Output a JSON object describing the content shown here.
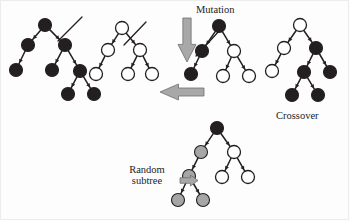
{
  "figure": {
    "background": "#fdfdfd",
    "width": 350,
    "height": 221
  },
  "palette": {
    "node_black": "#231f20",
    "node_white": "#ffffff",
    "node_gray": "#a6a6a6",
    "node_stroke": "#231f20",
    "edge": "#231f20",
    "arrow_fill": "#a8a8a8",
    "arrow_stroke": "#6f6f6f",
    "text": "#1c1c1c",
    "cut_line": "#231f20"
  },
  "labels": {
    "mutation": "Mutation",
    "crossover": "Crossover",
    "random_subtree": "Random\nsubtree",
    "random_subtree_line1": "Random",
    "random_subtree_line2": "subtree"
  },
  "arrows": [
    {
      "name": "mutation-arrow",
      "direction": "down",
      "x": 178,
      "y": 18,
      "width": 18,
      "height": 44,
      "fill": "#a8a8a8"
    },
    {
      "name": "crossover-arrow",
      "direction": "left",
      "x": 160,
      "y": 84,
      "width": 44,
      "height": 16,
      "fill": "#a8a8a8"
    },
    {
      "name": "random-subtree-arrow",
      "direction": "right",
      "x": 180,
      "y": 175,
      "width": 18,
      "height": 11,
      "fill": "#a8a8a8"
    }
  ],
  "trees": [
    {
      "name": "parent-tree-1",
      "role": "parent-1-black",
      "description": "Fully black parent tree with crossover cut mark on right edge from root",
      "cut_line": {
        "x1": 58,
        "y1": 41,
        "x2": 82,
        "y2": 17
      },
      "nodes": [
        {
          "id": "n0",
          "cx": 45,
          "cy": 25,
          "r": 6.5,
          "fill": "black"
        },
        {
          "id": "n1",
          "cx": 28,
          "cy": 45,
          "r": 6.5,
          "fill": "black"
        },
        {
          "id": "n2",
          "cx": 65,
          "cy": 45,
          "r": 6.5,
          "fill": "black"
        },
        {
          "id": "n3",
          "cx": 16,
          "cy": 70,
          "r": 6.5,
          "fill": "black"
        },
        {
          "id": "n4",
          "cx": 52,
          "cy": 70,
          "r": 6.5,
          "fill": "black"
        },
        {
          "id": "n5",
          "cx": 80,
          "cy": 71,
          "r": 6.5,
          "fill": "black"
        },
        {
          "id": "n6",
          "cx": 68,
          "cy": 94,
          "r": 6.5,
          "fill": "black"
        },
        {
          "id": "n7",
          "cx": 94,
          "cy": 94,
          "r": 6.5,
          "fill": "black"
        }
      ],
      "edges": [
        [
          "n0",
          "n1"
        ],
        [
          "n0",
          "n2"
        ],
        [
          "n1",
          "n3"
        ],
        [
          "n2",
          "n4"
        ],
        [
          "n2",
          "n5"
        ],
        [
          "n5",
          "n6"
        ],
        [
          "n5",
          "n7"
        ]
      ]
    },
    {
      "name": "parent-tree-2",
      "role": "parent-2-white",
      "description": "Fully white parent tree with crossover cut mark on right edge from root",
      "cut_line": {
        "x1": 124,
        "y1": 45,
        "x2": 146,
        "y2": 22
      },
      "nodes": [
        {
          "id": "n0",
          "cx": 122,
          "cy": 28,
          "r": 6.5,
          "fill": "white"
        },
        {
          "id": "n1",
          "cx": 108,
          "cy": 50,
          "r": 6.5,
          "fill": "white"
        },
        {
          "id": "n2",
          "cx": 140,
          "cy": 50,
          "r": 6.5,
          "fill": "white"
        },
        {
          "id": "n3",
          "cx": 96,
          "cy": 74,
          "r": 6.5,
          "fill": "white"
        },
        {
          "id": "n4",
          "cx": 128,
          "cy": 74,
          "r": 6.5,
          "fill": "white"
        },
        {
          "id": "n5",
          "cx": 152,
          "cy": 74,
          "r": 6.5,
          "fill": "white"
        }
      ],
      "edges": [
        [
          "n0",
          "n1"
        ],
        [
          "n0",
          "n2"
        ],
        [
          "n1",
          "n3"
        ],
        [
          "n2",
          "n4"
        ],
        [
          "n2",
          "n5"
        ]
      ]
    },
    {
      "name": "offspring-tree-1",
      "role": "child-1-mixed",
      "description": "Black root and black left subtree, white right subtree; cut mark on left edge",
      "cut_line": {
        "x1": 196,
        "y1": 56,
        "x2": 220,
        "y2": 30
      },
      "nodes": [
        {
          "id": "n0",
          "cx": 219,
          "cy": 26,
          "r": 6.5,
          "fill": "black"
        },
        {
          "id": "n1",
          "cx": 202,
          "cy": 51,
          "r": 6.5,
          "fill": "black"
        },
        {
          "id": "n2",
          "cx": 234,
          "cy": 51,
          "r": 6.5,
          "fill": "white"
        },
        {
          "id": "n3",
          "cx": 191,
          "cy": 74,
          "r": 6.5,
          "fill": "black"
        },
        {
          "id": "n4",
          "cx": 223,
          "cy": 76,
          "r": 6.5,
          "fill": "white"
        },
        {
          "id": "n5",
          "cx": 249,
          "cy": 76,
          "r": 6.5,
          "fill": "white"
        }
      ],
      "edges": [
        [
          "n0",
          "n1"
        ],
        [
          "n0",
          "n2"
        ],
        [
          "n1",
          "n3"
        ],
        [
          "n2",
          "n4"
        ],
        [
          "n2",
          "n5"
        ]
      ]
    },
    {
      "name": "offspring-tree-2",
      "role": "child-2-mixed",
      "description": "White root and white left subtree, black right subtree with black grandchildren",
      "cut_line": null,
      "nodes": [
        {
          "id": "n0",
          "cx": 300,
          "cy": 25,
          "r": 6.5,
          "fill": "white"
        },
        {
          "id": "n1",
          "cx": 284,
          "cy": 48,
          "r": 6.5,
          "fill": "white"
        },
        {
          "id": "n2",
          "cx": 316,
          "cy": 48,
          "r": 6.5,
          "fill": "black"
        },
        {
          "id": "n3",
          "cx": 272,
          "cy": 71,
          "r": 6.5,
          "fill": "white"
        },
        {
          "id": "n4",
          "cx": 304,
          "cy": 72,
          "r": 6.5,
          "fill": "black"
        },
        {
          "id": "n5",
          "cx": 330,
          "cy": 72,
          "r": 6.5,
          "fill": "black"
        },
        {
          "id": "n6",
          "cx": 292,
          "cy": 95,
          "r": 6.5,
          "fill": "black"
        },
        {
          "id": "n7",
          "cx": 318,
          "cy": 95,
          "r": 6.5,
          "fill": "black"
        }
      ],
      "edges": [
        [
          "n0",
          "n1"
        ],
        [
          "n0",
          "n2"
        ],
        [
          "n1",
          "n3"
        ],
        [
          "n2",
          "n4"
        ],
        [
          "n2",
          "n5"
        ],
        [
          "n4",
          "n6"
        ],
        [
          "n4",
          "n7"
        ]
      ]
    },
    {
      "name": "mutated-tree",
      "role": "mutation-result",
      "description": "Black root, gray randomly generated left subtree, white right subtree",
      "cut_line": null,
      "nodes": [
        {
          "id": "n0",
          "cx": 217,
          "cy": 128,
          "r": 6.5,
          "fill": "black"
        },
        {
          "id": "n1",
          "cx": 201,
          "cy": 152,
          "r": 6.5,
          "fill": "gray"
        },
        {
          "id": "n2",
          "cx": 234,
          "cy": 152,
          "r": 6.5,
          "fill": "white"
        },
        {
          "id": "n3",
          "cx": 189,
          "cy": 176,
          "r": 6.5,
          "fill": "gray"
        },
        {
          "id": "n4",
          "cx": 222,
          "cy": 177,
          "r": 6.5,
          "fill": "white"
        },
        {
          "id": "n5",
          "cx": 248,
          "cy": 177,
          "r": 6.5,
          "fill": "white"
        },
        {
          "id": "n6",
          "cx": 178,
          "cy": 200,
          "r": 6.5,
          "fill": "gray"
        },
        {
          "id": "n7",
          "cx": 203,
          "cy": 200,
          "r": 6.5,
          "fill": "gray"
        }
      ],
      "edges": [
        [
          "n0",
          "n1"
        ],
        [
          "n0",
          "n2"
        ],
        [
          "n1",
          "n3"
        ],
        [
          "n2",
          "n4"
        ],
        [
          "n2",
          "n5"
        ],
        [
          "n3",
          "n6"
        ],
        [
          "n3",
          "n7"
        ]
      ]
    }
  ]
}
